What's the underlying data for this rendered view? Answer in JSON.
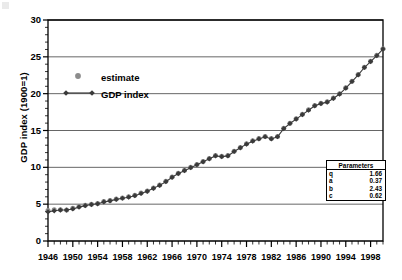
{
  "chart_data": {
    "type": "line",
    "title": "",
    "xlabel": "",
    "ylabel": "GDP index (1900=1)",
    "xlim": [
      1946,
      2000
    ],
    "ylim": [
      0,
      30
    ],
    "yticks": [
      0,
      5,
      10,
      15,
      20,
      25,
      30
    ],
    "xticks": [
      1946,
      1950,
      1954,
      1958,
      1962,
      1966,
      1970,
      1974,
      1978,
      1982,
      1986,
      1990,
      1994,
      1998
    ],
    "xtick_step_minor": 1,
    "grid": "horizontal",
    "legend_position": "upper-left",
    "legend": [
      "estimate",
      "GDP index"
    ],
    "x": [
      1946,
      1947,
      1948,
      1949,
      1950,
      1951,
      1952,
      1953,
      1954,
      1955,
      1956,
      1957,
      1958,
      1959,
      1960,
      1961,
      1962,
      1963,
      1964,
      1965,
      1966,
      1967,
      1968,
      1969,
      1970,
      1971,
      1972,
      1973,
      1974,
      1975,
      1976,
      1977,
      1978,
      1979,
      1980,
      1981,
      1982,
      1983,
      1984,
      1985,
      1986,
      1987,
      1988,
      1989,
      1990,
      1991,
      1992,
      1993,
      1994,
      1995,
      1996,
      1997,
      1998,
      1999,
      2000
    ],
    "series": [
      {
        "name": "estimate",
        "marker": "circle",
        "color": "#8c8c8c",
        "values": [
          4.15,
          4.25,
          4.25,
          4.2,
          4.45,
          4.7,
          4.85,
          5.0,
          5.1,
          5.35,
          5.5,
          5.7,
          5.85,
          6.0,
          6.2,
          6.5,
          6.8,
          7.2,
          7.6,
          8.1,
          8.7,
          9.2,
          9.6,
          10.0,
          10.4,
          10.8,
          11.2,
          11.6,
          11.5,
          11.6,
          12.2,
          12.7,
          13.2,
          13.6,
          13.9,
          14.2,
          13.9,
          14.2,
          15.3,
          16.0,
          16.6,
          17.2,
          17.8,
          18.4,
          18.7,
          18.9,
          19.4,
          20.0,
          20.8,
          21.7,
          22.6,
          23.6,
          24.4,
          25.2,
          26.1
        ]
      },
      {
        "name": "GDP index",
        "marker": "diamond",
        "color": "#3a3a3a",
        "values": [
          3.95,
          4.1,
          4.2,
          4.2,
          4.35,
          4.6,
          4.8,
          4.95,
          5.05,
          5.3,
          5.45,
          5.65,
          5.8,
          5.95,
          6.15,
          6.45,
          6.75,
          7.15,
          7.55,
          8.05,
          8.65,
          9.15,
          9.55,
          9.95,
          10.35,
          10.75,
          11.15,
          11.55,
          11.45,
          11.55,
          12.15,
          12.65,
          13.15,
          13.55,
          13.85,
          14.15,
          13.85,
          14.15,
          15.25,
          15.95,
          16.55,
          17.15,
          17.75,
          18.35,
          18.65,
          18.85,
          19.35,
          19.95,
          20.75,
          21.65,
          22.55,
          23.55,
          24.35,
          25.15,
          26.05
        ]
      }
    ]
  },
  "legend": {
    "estimate_label": "estimate",
    "gdp_label": "GDP index"
  },
  "axes": {
    "y_title": "GDP index (1900=1)",
    "y_ticks": [
      "0",
      "5",
      "10",
      "15",
      "20",
      "25",
      "30"
    ],
    "x_ticks": [
      "1946",
      "1950",
      "1954",
      "1958",
      "1962",
      "1966",
      "1970",
      "1974",
      "1978",
      "1982",
      "1986",
      "1990",
      "1994",
      "1998"
    ]
  },
  "parameters_table": {
    "header": "Parameters",
    "rows": [
      {
        "name": "q",
        "value": "1.66"
      },
      {
        "name": "a",
        "value": "0.37"
      },
      {
        "name": "b",
        "value": "2.43"
      },
      {
        "name": "c",
        "value": "0.62"
      }
    ]
  },
  "colors": {
    "estimate_marker": "#8c8c8c",
    "gdp_marker": "#3a3a3a",
    "gridline": "#555555",
    "axis": "#000000"
  }
}
